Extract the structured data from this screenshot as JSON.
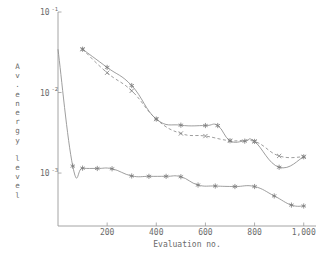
{
  "chart_data": {
    "type": "line",
    "title": "",
    "xlabel": "Evaluation no.",
    "ylabel": "Av. energy level",
    "ylabel_chars": [
      "A",
      "v",
      ".",
      "e",
      "n",
      "e",
      "r",
      "g",
      "y",
      "l",
      "e",
      "v",
      "e",
      "l"
    ],
    "xscale": "linear",
    "yscale": "log",
    "xlim": [
      0,
      1050
    ],
    "ylim": [
      0.00022,
      0.1
    ],
    "grid": false,
    "legend": "none",
    "xticks": [
      200,
      400,
      600,
      800,
      1000
    ],
    "xticklabels": [
      "200",
      "400",
      "600",
      "800",
      "1,000"
    ],
    "yticks": [
      0.1,
      0.01,
      0.001
    ],
    "yticklabels": [
      "10-1",
      "10-2",
      "10-3"
    ],
    "ytick_mantissa": "10",
    "ytick_exponents": [
      "-1",
      "-2",
      "-3"
    ],
    "marker_color": "#7b7b7b",
    "line_color": "#8d8d8d",
    "axis_color": "#9a9a9a",
    "series": [
      {
        "name": "upper-solid",
        "style": "solid",
        "marker": "asterisk",
        "x": [
          100,
          200,
          300,
          400,
          500,
          600,
          650,
          700,
          760,
          800,
          900,
          1000
        ],
        "y": [
          0.0345,
          0.0205,
          0.0122,
          0.00468,
          0.00393,
          0.00389,
          0.00389,
          0.00252,
          0.00249,
          0.00247,
          0.00118,
          0.00159
        ]
      },
      {
        "name": "middle-dashed",
        "style": "dashed",
        "marker": "cross",
        "x": [
          100,
          200,
          300,
          400,
          500,
          600,
          700,
          800,
          900,
          1000
        ],
        "y": [
          0.0345,
          0.0176,
          0.0105,
          0.00468,
          0.0031,
          0.00288,
          0.00252,
          0.00247,
          0.00163,
          0.00159
        ]
      },
      {
        "name": "lower-solid",
        "style": "solid",
        "marker": "asterisk",
        "x": [
          0,
          60,
          100,
          160,
          220,
          300,
          370,
          440,
          500,
          570,
          640,
          720,
          800,
          880,
          950,
          1000
        ],
        "y": [
          0.0345,
          0.00122,
          0.00115,
          0.00114,
          0.00113,
          0.00092,
          0.00091,
          0.00091,
          0.0009,
          0.00071,
          0.00069,
          0.00068,
          0.00068,
          0.00052,
          0.0004,
          0.00039
        ]
      }
    ]
  }
}
